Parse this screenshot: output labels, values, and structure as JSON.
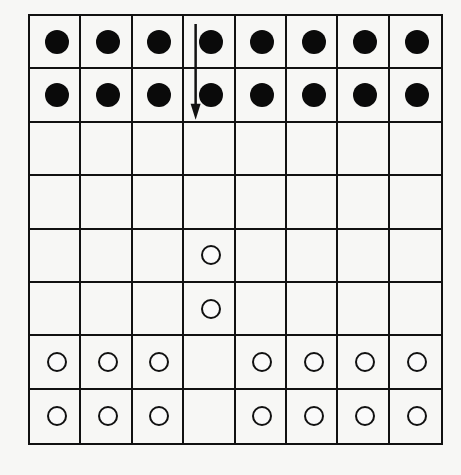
{
  "board": {
    "rows": 8,
    "cols": 8,
    "line_color": "#111111",
    "background": "#f7f7f5",
    "legend": {
      "B": "black-piece",
      "W": "white-piece",
      ".": "empty"
    },
    "cells": [
      [
        "B",
        "B",
        "B",
        "B",
        "B",
        "B",
        "B",
        "B"
      ],
      [
        "B",
        "B",
        "B",
        "B",
        "B",
        "B",
        "B",
        "B"
      ],
      [
        ".",
        ".",
        ".",
        ".",
        ".",
        ".",
        ".",
        "."
      ],
      [
        ".",
        ".",
        ".",
        ".",
        ".",
        ".",
        ".",
        "."
      ],
      [
        ".",
        ".",
        ".",
        "W",
        ".",
        ".",
        ".",
        "."
      ],
      [
        ".",
        ".",
        ".",
        "W",
        ".",
        ".",
        ".",
        "."
      ],
      [
        "W",
        "W",
        "W",
        ".",
        "W",
        "W",
        "W",
        "W"
      ],
      [
        "W",
        "W",
        "W",
        ".",
        "W",
        "W",
        "W",
        "W"
      ]
    ]
  },
  "arrow": {
    "description": "downward move arrow along left edge of column 4",
    "from": {
      "row": 0,
      "col": 3
    },
    "to": {
      "row": 1,
      "col": 3
    },
    "direction": "down"
  },
  "pieces": {
    "black_count": 16,
    "white_count": 16
  }
}
